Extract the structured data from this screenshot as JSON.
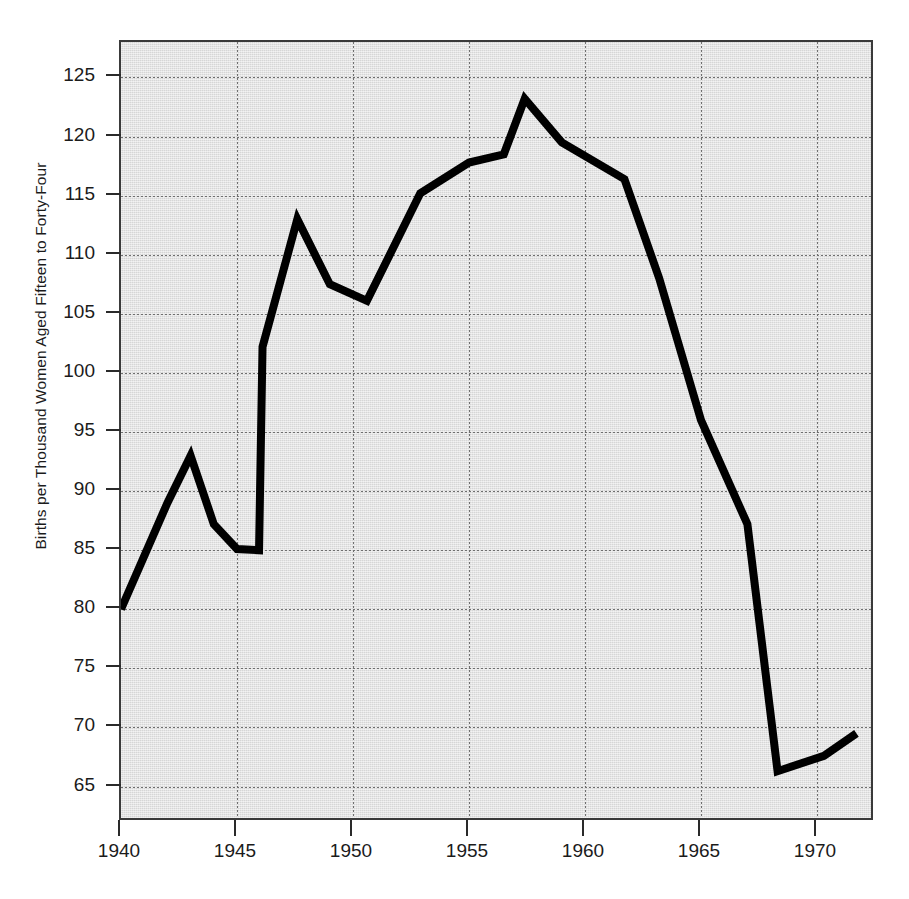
{
  "chart_data": {
    "type": "line",
    "title": "",
    "xlabel": "",
    "ylabel": "Births per Thousand Women Aged Fifteen to Forty-Four",
    "xlim": [
      1940,
      1972.5
    ],
    "ylim": [
      62,
      128
    ],
    "grid": true,
    "legend": null,
    "xticks": [
      1940,
      1945,
      1950,
      1955,
      1960,
      1965,
      1970
    ],
    "xtick_labels": [
      "1940",
      "1945",
      "1950",
      "1955",
      "1960",
      "1965",
      "1970"
    ],
    "yticks": [
      65,
      70,
      75,
      80,
      85,
      90,
      95,
      100,
      105,
      110,
      115,
      120,
      125
    ],
    "ytick_labels": [
      "65",
      "70",
      "75",
      "80",
      "85",
      "90",
      "95",
      "100",
      "105",
      "110",
      "115",
      "120",
      "125"
    ],
    "series": [
      {
        "name": "General Fertility Rate",
        "color": "#000000",
        "x": [
          1940,
          1942,
          1943,
          1944,
          1945,
          1945.95,
          1946.1,
          1947.6,
          1949,
          1950.6,
          1952.9,
          1955,
          1956.5,
          1957.4,
          1959,
          1961.7,
          1963.2,
          1965,
          1967,
          1968.3,
          1970.3,
          1971.7
        ],
        "y": [
          80.0,
          89.0,
          93.0,
          87.2,
          85.1,
          85.0,
          102.2,
          113.0,
          107.5,
          106.1,
          115.2,
          117.8,
          118.5,
          123.2,
          119.5,
          116.4,
          108.0,
          96.0,
          87.2,
          66.3,
          67.6,
          69.5
        ]
      }
    ],
    "annotations": []
  },
  "axes": {
    "y_title": "Births per Thousand Women Aged Fifteen to Forty-Four"
  }
}
